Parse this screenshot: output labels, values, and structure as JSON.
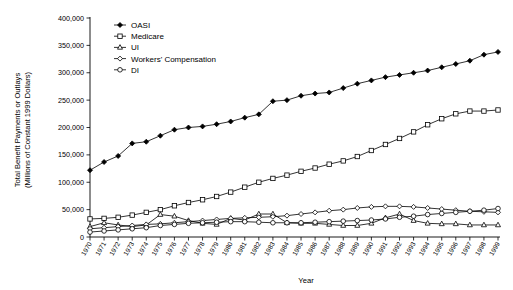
{
  "chart_data": {
    "type": "line",
    "title": "",
    "xlabel": "Year",
    "ylabel": "Total Benefit Payments or Outlays (Millions of Constant 1999 Dollars)",
    "ylabel_line1": "Total Benefit Payments or Outlays",
    "ylabel_line2": "(Millions of Constant 1999 Dollars)",
    "ylim": [
      0,
      400000
    ],
    "ytick_values": [
      0,
      50000,
      100000,
      150000,
      200000,
      250000,
      300000,
      350000,
      400000
    ],
    "ytick_labels": [
      "0",
      "50,000",
      "100,000",
      "150,000",
      "200,000",
      "250,000",
      "300,000",
      "350,000",
      "400,000"
    ],
    "grid": false,
    "legend_position": "top-left-inside",
    "categories": [
      "1970",
      "1971",
      "1972",
      "1973",
      "1974",
      "1975",
      "1976",
      "1977",
      "1978",
      "1979",
      "1980",
      "1981",
      "1982",
      "1983",
      "1984",
      "1985",
      "1986",
      "1987",
      "1988",
      "1989",
      "1990",
      "1991",
      "1992",
      "1993",
      "1994",
      "1995",
      "1996",
      "1997",
      "1998",
      "1999"
    ],
    "series": [
      {
        "name": "OASI",
        "marker": "filled-diamond",
        "values": [
          122000,
          137000,
          148000,
          171000,
          174000,
          185000,
          196000,
          200000,
          202000,
          206000,
          211000,
          218000,
          224000,
          248000,
          250000,
          258000,
          262000,
          264000,
          272000,
          280000,
          286000,
          292000,
          296000,
          300000,
          304000,
          310000,
          316000,
          322000,
          333000,
          338000
        ]
      },
      {
        "name": "Medicare",
        "marker": "open-square",
        "values": [
          33000,
          34000,
          36000,
          40000,
          45000,
          50000,
          57000,
          63000,
          68000,
          74000,
          82000,
          91000,
          100000,
          107000,
          113000,
          120000,
          126000,
          133000,
          139000,
          147000,
          158000,
          169000,
          180000,
          192000,
          205000,
          216000,
          225000,
          230000,
          230000,
          232000
        ]
      },
      {
        "name": "UI",
        "marker": "open-triangle",
        "values": [
          19000,
          26000,
          22000,
          19000,
          22000,
          41000,
          38000,
          30000,
          25000,
          23000,
          34000,
          31000,
          42000,
          42000,
          26000,
          25000,
          25000,
          23000,
          21000,
          21000,
          25000,
          35000,
          42000,
          30000,
          25000,
          24000,
          24000,
          22000,
          22000,
          22000
        ]
      },
      {
        "name": "Workers' Compensation",
        "marker": "open-diamond",
        "values": [
          15000,
          17000,
          19000,
          21000,
          23000,
          24000,
          26000,
          28000,
          30000,
          32000,
          34000,
          35000,
          36000,
          37000,
          39000,
          42000,
          45000,
          48000,
          50000,
          53000,
          55000,
          56000,
          56000,
          55000,
          53000,
          51000,
          49000,
          47000,
          46000,
          45000
        ]
      },
      {
        "name": "DI",
        "marker": "open-circle",
        "values": [
          9000,
          11000,
          13000,
          15000,
          17000,
          21000,
          23000,
          25000,
          26000,
          27000,
          28000,
          28000,
          27000,
          26000,
          26000,
          26000,
          27000,
          28000,
          29000,
          30000,
          31000,
          33000,
          36000,
          38000,
          41000,
          43000,
          45000,
          47000,
          49000,
          52000
        ]
      }
    ]
  },
  "legend": {
    "items": [
      {
        "label": "OASI",
        "marker": "filled-diamond"
      },
      {
        "label": "Medicare",
        "marker": "open-square"
      },
      {
        "label": "UI",
        "marker": "open-triangle"
      },
      {
        "label": "Workers' Compensation",
        "marker": "open-diamond"
      },
      {
        "label": "DI",
        "marker": "open-circle"
      }
    ]
  }
}
